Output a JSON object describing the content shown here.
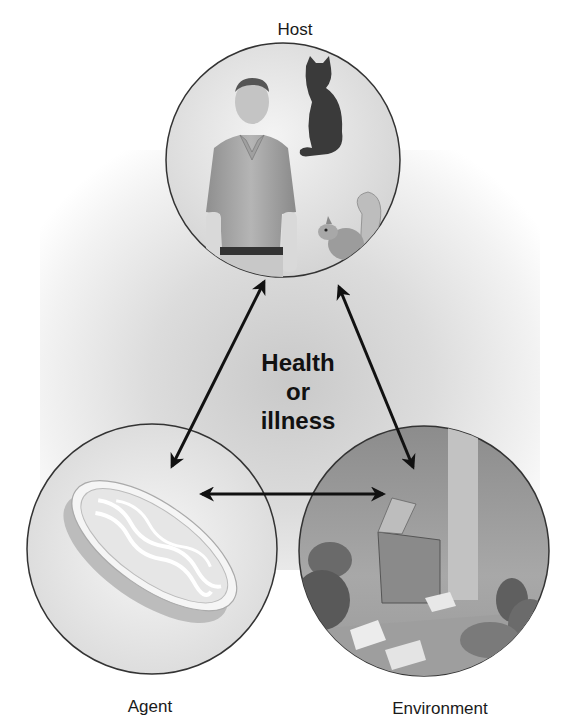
{
  "diagram": {
    "type": "epidemiologic-triangle",
    "nodes": [
      {
        "id": "host",
        "label": "Host",
        "contents": [
          "man",
          "cat",
          "squirrel"
        ]
      },
      {
        "id": "agent",
        "label": "Agent",
        "contents": [
          "petri-dish"
        ]
      },
      {
        "id": "environment",
        "label": "Environment",
        "contents": [
          "dumpster",
          "garbage-bags",
          "scattered-papers",
          "alley"
        ]
      }
    ],
    "center": {
      "lines": [
        "Health",
        "or",
        "illness"
      ]
    },
    "edges": [
      {
        "from": "host",
        "to": "agent",
        "direction": "bidirectional"
      },
      {
        "from": "host",
        "to": "environment",
        "direction": "bidirectional"
      },
      {
        "from": "agent",
        "to": "environment",
        "direction": "bidirectional"
      }
    ]
  },
  "colors": {
    "background": "#ffffff",
    "circle_stroke": "#333333",
    "arrow": "#111111",
    "text": "#1a1a1a"
  }
}
